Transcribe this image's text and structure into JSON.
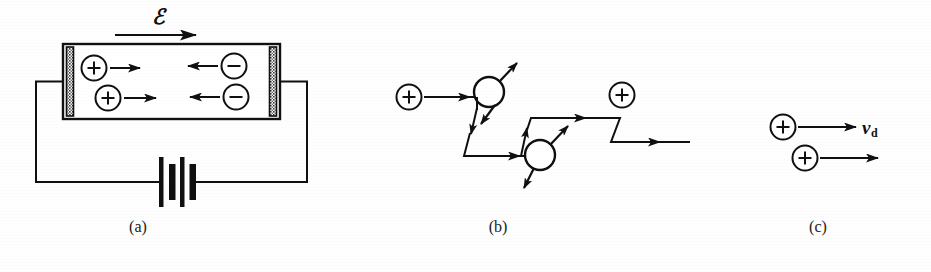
{
  "figure": {
    "width": 931,
    "height": 272,
    "background_color": "#fefefe",
    "ink_color": "#101010"
  },
  "panels": [
    {
      "id": "a",
      "caption": "(a)",
      "description": "Conductor with electrodes connected to a battery; electric field drives positive charges right and negative charges left",
      "labels": {
        "field_symbol": "ℰ",
        "field_symbol_name": "script-capital-e-electric-field"
      },
      "charges": [
        {
          "sign": "+",
          "symbol": "+",
          "row": "top",
          "arrow_direction": "right"
        },
        {
          "sign": "-",
          "symbol": "−",
          "row": "top",
          "arrow_direction": "left"
        },
        {
          "sign": "+",
          "symbol": "+",
          "row": "bottom",
          "arrow_direction": "right"
        },
        {
          "sign": "-",
          "symbol": "−",
          "row": "bottom",
          "arrow_direction": "left"
        }
      ],
      "components": [
        {
          "name": "conductor-body",
          "type": "rectangle"
        },
        {
          "name": "left-electrode",
          "type": "hatched-bar"
        },
        {
          "name": "right-electrode",
          "type": "hatched-bar"
        },
        {
          "name": "battery",
          "type": "two-cell-battery"
        },
        {
          "name": "circuit-wire",
          "type": "closed-loop"
        }
      ]
    },
    {
      "id": "b",
      "caption": "(b)",
      "description": "Zigzag random-walk trajectory of a charge carrier undergoing scattering collisions",
      "charges": [
        {
          "sign": "+",
          "symbol": "+",
          "position": "start-left"
        },
        {
          "sign": "+",
          "symbol": "+",
          "position": "upper-right"
        }
      ],
      "scattering_centers": 2,
      "path_segments": 8
    },
    {
      "id": "c",
      "caption": "(c)",
      "description": "Net drift motion of positive charges with drift velocity",
      "labels": {
        "drift_velocity": "v",
        "drift_velocity_subscript": "d",
        "drift_velocity_name": "drift-velocity-v-sub-d"
      },
      "charges": [
        {
          "sign": "+",
          "symbol": "+",
          "row": "top",
          "arrow_direction": "right"
        },
        {
          "sign": "+",
          "symbol": "+",
          "row": "bottom",
          "arrow_direction": "right"
        }
      ]
    }
  ]
}
